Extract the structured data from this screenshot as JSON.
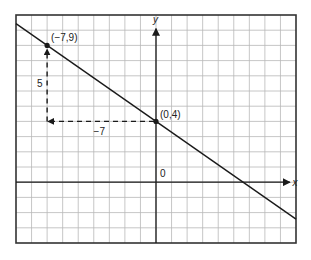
{
  "graph": {
    "x_range": [
      -9,
      9
    ],
    "y_range": [
      -4,
      11
    ],
    "x_axis_label": "x",
    "y_axis_label": "y",
    "origin_label": "0",
    "grid_color": "#b8b8b8",
    "line_color": "#1a1a1a"
  },
  "line": {
    "equation": "y = -5/7 x + 4",
    "slope": -0.7142857,
    "intercept": 4
  },
  "points": [
    {
      "label": "(−7,9)",
      "x": -7,
      "y": 9
    },
    {
      "label": "(0,4)",
      "x": 0,
      "y": 4
    }
  ],
  "annotations": {
    "rise_label": "5",
    "run_label": "−7"
  }
}
